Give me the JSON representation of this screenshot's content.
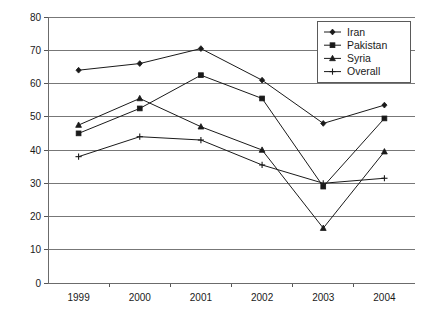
{
  "chart_data": {
    "type": "line",
    "title": "",
    "xlabel": "",
    "ylabel": "",
    "categories": [
      "1999",
      "2000",
      "2001",
      "2002",
      "2003",
      "2004"
    ],
    "x": [
      1999,
      2000,
      2001,
      2002,
      2003,
      2004
    ],
    "ylim": [
      0,
      80
    ],
    "xlim_labels": [
      "1999",
      "2004"
    ],
    "ytick_labels": [
      "0",
      "10",
      "20",
      "30",
      "40",
      "50",
      "60",
      "70",
      "80"
    ],
    "yticks": [
      0,
      10,
      20,
      30,
      40,
      50,
      60,
      70,
      80
    ],
    "grid": "horizontal",
    "legend_position": "top-right",
    "series": [
      {
        "name": "Iran",
        "marker": "diamond",
        "color": "#1a1a1a",
        "values": [
          64,
          66,
          70.5,
          61,
          48,
          53.5
        ]
      },
      {
        "name": "Pakistan",
        "marker": "square",
        "color": "#1a1a1a",
        "values": [
          45,
          52.5,
          62.5,
          55.5,
          29,
          49.5
        ]
      },
      {
        "name": "Syria",
        "marker": "triangle",
        "color": "#1a1a1a",
        "values": [
          47.5,
          55.5,
          47,
          40,
          16.5,
          39.5
        ]
      },
      {
        "name": "Overall",
        "marker": "cross",
        "color": "#1a1a1a",
        "values": [
          38,
          44,
          43,
          35.5,
          30,
          31.5
        ]
      }
    ]
  },
  "legend": {
    "items": [
      {
        "label": "Iran",
        "marker": "diamond"
      },
      {
        "label": "Pakistan",
        "marker": "square"
      },
      {
        "label": "Syria",
        "marker": "triangle"
      },
      {
        "label": "Overall",
        "marker": "cross"
      }
    ]
  },
  "axes": {
    "y_ticks": [
      "80",
      "70",
      "60",
      "50",
      "40",
      "30",
      "20",
      "10",
      "0"
    ],
    "x_ticks": [
      "1999",
      "2000",
      "2001",
      "2002",
      "2003",
      "2004"
    ]
  },
  "colors": {
    "ink": "#1a1a1a",
    "grid": "#777777",
    "axis": "#6b6b6b",
    "background": "#ffffff"
  }
}
